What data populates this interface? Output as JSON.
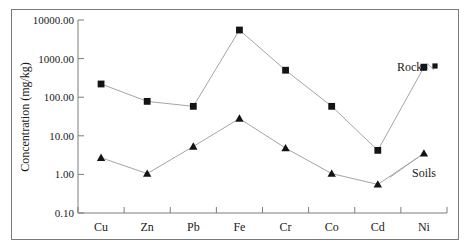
{
  "chart_data": {
    "type": "line",
    "title": "",
    "xlabel": "",
    "ylabel": "Concentration (mg/kg)",
    "yscale": "log",
    "ylim": [
      0.1,
      10000.0
    ],
    "grid": false,
    "legend_position": "inline-right",
    "categories": [
      "Cu",
      "Zn",
      "Pb",
      "Fe",
      "Cr",
      "Co",
      "Cd",
      "Ni"
    ],
    "ytick_labels": [
      "10000.00",
      "1000.00",
      "100.00",
      "10.00",
      "1.00",
      "0.10"
    ],
    "ytick_values": [
      10000,
      1000,
      100,
      10,
      1,
      0.1
    ],
    "series": [
      {
        "name": "Rocks",
        "marker": "square",
        "values": [
          220,
          78,
          58,
          5500,
          500,
          58,
          4.2,
          600
        ]
      },
      {
        "name": "Soils",
        "marker": "triangle",
        "values": [
          2.7,
          1.05,
          5.3,
          28,
          4.8,
          1.05,
          0.55,
          3.5
        ]
      }
    ],
    "annotations": [
      {
        "text": "Rocks",
        "series": "Rocks",
        "anchor": "Ni"
      },
      {
        "text": "Soils",
        "series": "Soils",
        "anchor": "Ni"
      }
    ]
  },
  "axis": {
    "y_title": "Concentration (mg/kg)"
  }
}
